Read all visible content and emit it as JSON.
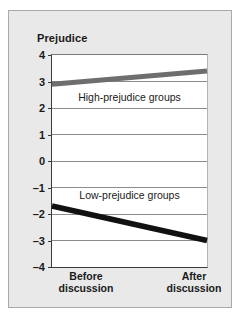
{
  "chart_data": {
    "type": "line",
    "title": "Prejudice",
    "xlabel": "",
    "ylabel": "Prejudice",
    "categories": [
      "Before discussion",
      "After discussion"
    ],
    "category_lines": [
      [
        "Before",
        "discussion"
      ],
      [
        "After",
        "discussion"
      ]
    ],
    "ylim": [
      -4,
      4
    ],
    "yticks": [
      4,
      3,
      2,
      1,
      0,
      -1,
      -2,
      -3,
      -4
    ],
    "ytick_labels": [
      "4",
      "3",
      "2",
      "1",
      "0",
      "–1",
      "–2",
      "–3",
      "–4"
    ],
    "grid": true,
    "legend_position": "inline-annotations",
    "series": [
      {
        "name": "High-prejudice groups",
        "values": [
          2.9,
          3.4
        ],
        "color": "#6e6e6e",
        "label_text": "High-prejudice groups"
      },
      {
        "name": "Low-prejudice groups",
        "values": [
          -1.7,
          -3.0
        ],
        "color": "#111111",
        "label_text": "Low-prejudice groups"
      }
    ],
    "annotations": [
      {
        "text": "High-prejudice groups",
        "x": 0.5,
        "y": 2.4
      },
      {
        "text": "Low-prejudice groups",
        "x": 0.5,
        "y": -1.3
      }
    ]
  },
  "figure": {
    "panel_background": "#e9e9e9",
    "plot_background": "#ffffff",
    "border_color": "#a9a9a9",
    "axis_color": "#3a3a3a",
    "gridline_color": "#8c8c8c",
    "text_color": "#1a1a1a"
  }
}
